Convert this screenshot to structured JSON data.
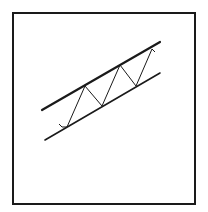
{
  "diagram": {
    "type": "ascending-trend-channel",
    "colors": {
      "background": "#ffffff",
      "stroke": "#1a1a1a"
    },
    "frame": {
      "x": 12,
      "y": 12,
      "width": 182,
      "height": 191
    },
    "upper_trendline": {
      "x1": 42,
      "y1": 110,
      "x2": 160,
      "y2": 42,
      "stroke_width": 2.2
    },
    "lower_trendline": {
      "x1": 45,
      "y1": 140,
      "x2": 160,
      "y2": 73,
      "stroke_width": 1.6
    },
    "price_path": [
      [
        59,
        124
      ],
      [
        62,
        127
      ],
      [
        67,
        127
      ],
      [
        85,
        86
      ],
      [
        102,
        106
      ],
      [
        120,
        65
      ],
      [
        136,
        86
      ],
      [
        152,
        49
      ],
      [
        155,
        52
      ]
    ]
  }
}
